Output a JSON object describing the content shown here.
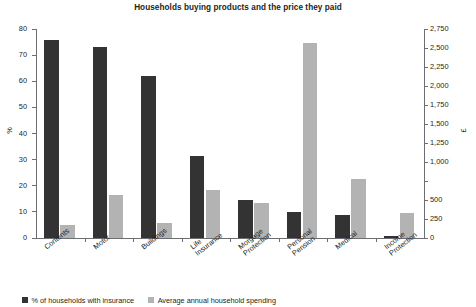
{
  "chart_data": {
    "type": "bar",
    "title": "Households buying products and the price they paid",
    "categories": [
      "Contents",
      "Motor",
      "Buildings",
      "Life\nInsurance",
      "Morgage\nProtection",
      "Personal\nPension",
      "Medical",
      "Income\nProtection"
    ],
    "series": [
      {
        "name": "% of households with insurance",
        "axis": "left",
        "color": "#333333",
        "values": [
          75.8,
          73.2,
          62.0,
          31.5,
          14.5,
          9.9,
          9.0,
          0.7
        ]
      },
      {
        "name": "Average annual household spending",
        "axis": "right",
        "color": "#b3b3b3",
        "values": [
          170,
          560,
          195,
          630,
          455,
          2560,
          770,
          330
        ]
      }
    ],
    "xlabel": "",
    "ylabel": "%",
    "y2label": "£",
    "ylim": [
      0,
      80
    ],
    "y2lim": [
      0,
      2750
    ],
    "yticks": [
      "0",
      "10",
      "20",
      "30",
      "40",
      "50",
      "60",
      "70",
      "80"
    ],
    "y2ticks": [
      "0",
      "250",
      "500",
      "",
      "1,000",
      "1,250",
      "1,500",
      "1,750",
      "2,000",
      "2,250",
      "2,500",
      "2,750"
    ],
    "grid": false,
    "legend_position": "bottom-left"
  },
  "legend": [
    {
      "label": "% of households with insurance"
    },
    {
      "label": "Average annual household spending"
    }
  ]
}
